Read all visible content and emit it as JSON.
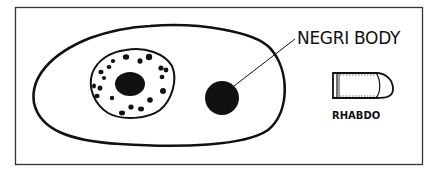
{
  "diagram": {
    "labels": {
      "negri_body": "NEGRI BODY",
      "rhabdo": "RHABDO"
    },
    "colors": {
      "ink": "#111111",
      "background": "#ffffff",
      "border": "#333333"
    },
    "elements": [
      {
        "id": "cell",
        "shape": "elongated oval outline"
      },
      {
        "id": "nucleus",
        "shape": "round outline with chromatin dots"
      },
      {
        "id": "nucleolus",
        "shape": "filled oval inside nucleus"
      },
      {
        "id": "negri-body",
        "shape": "filled circle in cytoplasm"
      },
      {
        "id": "rhabdovirus",
        "shape": "bullet shape"
      }
    ]
  }
}
